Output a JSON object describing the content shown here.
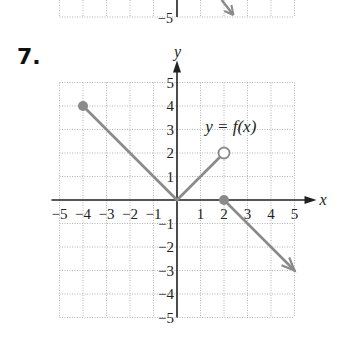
{
  "problem_number": "7.",
  "previous_fragment": {
    "tick_label": "−5"
  },
  "chart_data": {
    "type": "line",
    "title": "",
    "annotation": "y = f(x)",
    "xlabel": "x",
    "ylabel": "y",
    "xlim": [
      -5,
      5
    ],
    "ylim": [
      -5,
      5
    ],
    "grid": true,
    "x_ticks": [
      -5,
      -4,
      -3,
      -2,
      -1,
      1,
      2,
      3,
      4,
      5
    ],
    "y_ticks": [
      -5,
      -4,
      -3,
      -2,
      -1,
      1,
      2,
      3,
      4,
      5
    ],
    "x_tick_labels": [
      "−5",
      "−4",
      "−3",
      "−2",
      "−1",
      "1",
      "2",
      "3",
      "4",
      "5"
    ],
    "y_tick_labels": [
      "−5",
      "−4",
      "−3",
      "−2",
      "−1",
      "1",
      "2",
      "3",
      "4",
      "5"
    ],
    "series": [
      {
        "name": "segment-1",
        "points": [
          [
            -4,
            4
          ],
          [
            0,
            0
          ]
        ],
        "start": "closed",
        "end": "none"
      },
      {
        "name": "segment-2",
        "points": [
          [
            0,
            0
          ],
          [
            2,
            2
          ]
        ],
        "start": "none",
        "end": "open"
      },
      {
        "name": "ray-3",
        "points": [
          [
            2,
            0
          ],
          [
            5,
            -3
          ]
        ],
        "start": "closed",
        "end": "arrow"
      }
    ],
    "line_color": "#8a8a8a",
    "axis_color": "#222222",
    "grid_color": "#b5b5b5"
  }
}
